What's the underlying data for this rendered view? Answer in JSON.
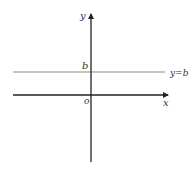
{
  "diagram": {
    "title": "",
    "axes": {
      "x_label": "x",
      "y_label": "y",
      "origin_label": "o",
      "axis_color": "#222222"
    },
    "line": {
      "equation_label": "y=b",
      "intercept_label": "b",
      "color": "#8a8a8a",
      "type": "horizontal"
    }
  }
}
